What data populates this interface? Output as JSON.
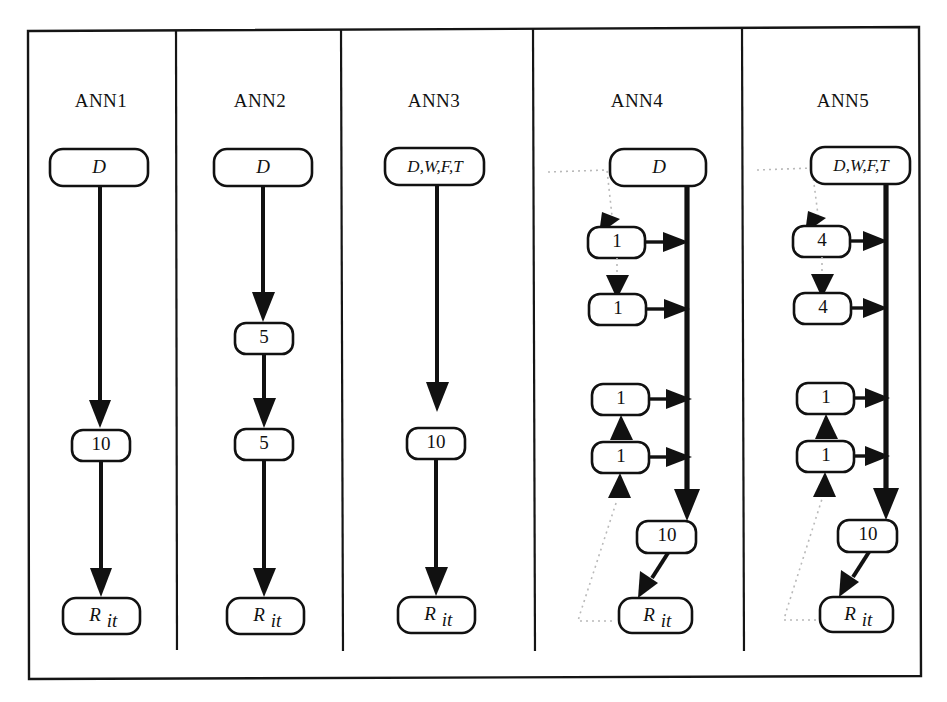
{
  "figure": {
    "caption_title": "ANN architectures",
    "panels": [
      {
        "id": "ann1",
        "title": "ANN1",
        "nodes": [
          {
            "id": "ann1-input",
            "label": "D",
            "style": "italic",
            "role": "input-layer"
          },
          {
            "id": "ann1-hidden",
            "label": "10",
            "style": "roman",
            "role": "hidden-layer"
          },
          {
            "id": "ann1-output",
            "label": "Rit",
            "style": "italic",
            "role": "output-layer"
          }
        ],
        "edges": [
          {
            "from": "ann1-input",
            "to": "ann1-hidden",
            "kind": "solid"
          },
          {
            "from": "ann1-hidden",
            "to": "ann1-output",
            "kind": "solid"
          }
        ]
      },
      {
        "id": "ann2",
        "title": "ANN2",
        "nodes": [
          {
            "id": "ann2-input",
            "label": "D",
            "style": "italic",
            "role": "input-layer"
          },
          {
            "id": "ann2-hidden1",
            "label": "5",
            "style": "roman",
            "role": "hidden-layer"
          },
          {
            "id": "ann2-hidden2",
            "label": "5",
            "style": "roman",
            "role": "hidden-layer"
          },
          {
            "id": "ann2-output",
            "label": "Rit",
            "style": "italic",
            "role": "output-layer"
          }
        ],
        "edges": [
          {
            "from": "ann2-input",
            "to": "ann2-hidden1",
            "kind": "solid"
          },
          {
            "from": "ann2-hidden1",
            "to": "ann2-hidden2",
            "kind": "solid"
          },
          {
            "from": "ann2-hidden2",
            "to": "ann2-output",
            "kind": "solid"
          }
        ]
      },
      {
        "id": "ann3",
        "title": "ANN3",
        "nodes": [
          {
            "id": "ann3-input",
            "label": "D,W,F,T",
            "style": "italic",
            "role": "input-layer"
          },
          {
            "id": "ann3-hidden",
            "label": "10",
            "style": "roman",
            "role": "hidden-layer"
          },
          {
            "id": "ann3-output",
            "label": "Rit",
            "style": "italic",
            "role": "output-layer"
          }
        ],
        "edges": [
          {
            "from": "ann3-input",
            "to": "ann3-hidden",
            "kind": "solid"
          },
          {
            "from": "ann3-hidden",
            "to": "ann3-output",
            "kind": "solid"
          }
        ]
      },
      {
        "id": "ann4",
        "title": "ANN4",
        "nodes": [
          {
            "id": "ann4-input",
            "label": "D",
            "style": "italic",
            "role": "input-layer"
          },
          {
            "id": "ann4-r1",
            "label": "1",
            "style": "roman",
            "role": "recurrent-unit"
          },
          {
            "id": "ann4-r2",
            "label": "1",
            "style": "roman",
            "role": "recurrent-unit"
          },
          {
            "id": "ann4-r3",
            "label": "1",
            "style": "roman",
            "role": "recurrent-unit"
          },
          {
            "id": "ann4-r4",
            "label": "1",
            "style": "roman",
            "role": "recurrent-unit"
          },
          {
            "id": "ann4-hidden",
            "label": "10",
            "style": "roman",
            "role": "hidden-layer"
          },
          {
            "id": "ann4-output",
            "label": "Rit",
            "style": "italic",
            "role": "output-layer"
          }
        ],
        "edges": [
          {
            "from": "ann4-input",
            "to": "ann4-bus",
            "kind": "solid-bus"
          },
          {
            "from": "ann4-r1",
            "to": "ann4-bus",
            "kind": "solid"
          },
          {
            "from": "ann4-r2",
            "to": "ann4-bus",
            "kind": "solid"
          },
          {
            "from": "ann4-r3",
            "to": "ann4-bus",
            "kind": "solid"
          },
          {
            "from": "ann4-r4",
            "to": "ann4-bus",
            "kind": "solid"
          },
          {
            "from": "ann4-bus",
            "to": "ann4-hidden",
            "kind": "solid"
          },
          {
            "from": "ann4-hidden",
            "to": "ann4-output",
            "kind": "solid"
          },
          {
            "from": "ann4-input",
            "to": "ann4-r1",
            "kind": "dotted-feedback"
          },
          {
            "from": "ann4-r1",
            "to": "ann4-r2",
            "kind": "dotted-feedback"
          },
          {
            "from": "ann4-r3",
            "to": "ann4-r2",
            "kind": "dotted-feedback"
          },
          {
            "from": "ann4-output",
            "to": "ann4-r4",
            "kind": "dotted-feedback"
          }
        ]
      },
      {
        "id": "ann5",
        "title": "ANN5",
        "nodes": [
          {
            "id": "ann5-input",
            "label": "D,W,F,T",
            "style": "italic",
            "role": "input-layer"
          },
          {
            "id": "ann5-r1",
            "label": "4",
            "style": "roman",
            "role": "recurrent-unit"
          },
          {
            "id": "ann5-r2",
            "label": "4",
            "style": "roman",
            "role": "recurrent-unit"
          },
          {
            "id": "ann5-r3",
            "label": "1",
            "style": "roman",
            "role": "recurrent-unit"
          },
          {
            "id": "ann5-r4",
            "label": "1",
            "style": "roman",
            "role": "recurrent-unit"
          },
          {
            "id": "ann5-hidden",
            "label": "10",
            "style": "roman",
            "role": "hidden-layer"
          },
          {
            "id": "ann5-output",
            "label": "Rit",
            "style": "italic",
            "role": "output-layer"
          }
        ],
        "edges": [
          {
            "from": "ann5-input",
            "to": "ann5-bus",
            "kind": "solid-bus"
          },
          {
            "from": "ann5-r1",
            "to": "ann5-bus",
            "kind": "solid"
          },
          {
            "from": "ann5-r2",
            "to": "ann5-bus",
            "kind": "solid"
          },
          {
            "from": "ann5-r3",
            "to": "ann5-bus",
            "kind": "solid"
          },
          {
            "from": "ann5-r4",
            "to": "ann5-bus",
            "kind": "solid"
          },
          {
            "from": "ann5-bus",
            "to": "ann5-hidden",
            "kind": "solid"
          },
          {
            "from": "ann5-hidden",
            "to": "ann5-output",
            "kind": "solid"
          },
          {
            "from": "ann5-input",
            "to": "ann5-r1",
            "kind": "dotted-feedback"
          },
          {
            "from": "ann5-r1",
            "to": "ann5-r2",
            "kind": "dotted-feedback"
          },
          {
            "from": "ann5-r3",
            "to": "ann5-r2",
            "kind": "dotted-feedback"
          },
          {
            "from": "ann5-output",
            "to": "ann5-r4",
            "kind": "dotted-feedback"
          }
        ]
      }
    ]
  },
  "labels": {
    "ann1": {
      "title": "ANN1",
      "n_input": "D",
      "n_hidden": "10",
      "n_output_base": "R",
      "n_output_sub": "it"
    },
    "ann2": {
      "title": "ANN2",
      "n_input": "D",
      "n_hidden1": "5",
      "n_hidden2": "5",
      "n_output_base": "R",
      "n_output_sub": "it"
    },
    "ann3": {
      "title": "ANN3",
      "n_input": "D,W,F,T",
      "n_hidden": "10",
      "n_output_base": "R",
      "n_output_sub": "it"
    },
    "ann4": {
      "title": "ANN4",
      "n_input": "D",
      "n_r1": "1",
      "n_r2": "1",
      "n_r3": "1",
      "n_r4": "1",
      "n_hidden": "10",
      "n_output_base": "R",
      "n_output_sub": "it"
    },
    "ann5": {
      "title": "ANN5",
      "n_input": "D,W,F,T",
      "n_r1": "4",
      "n_r2": "4",
      "n_r3": "1",
      "n_r4": "1",
      "n_hidden": "10",
      "n_output_base": "R",
      "n_output_sub": "it"
    }
  },
  "colors": {
    "ink": "#111111",
    "frame": "#151515",
    "background": "#ffffff",
    "dotted": "#b9b9b9"
  }
}
